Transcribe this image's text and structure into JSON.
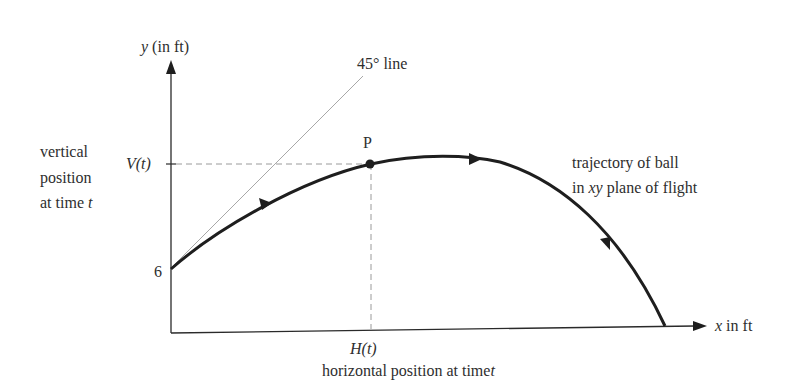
{
  "axes": {
    "y_label_var": "y",
    "y_label_unit": "(in ft)",
    "x_label_var": "x",
    "x_label_unit": "in ft",
    "y_intercept_label": "6"
  },
  "line_45": {
    "label": "45° line"
  },
  "point": {
    "label": "P"
  },
  "vertical": {
    "tick_label": "V(t)",
    "desc_line1": "vertical",
    "desc_line2": "position",
    "desc_line3_prefix": "at time ",
    "desc_line3_var": "t"
  },
  "horizontal": {
    "tick_label": "H(t)",
    "desc_prefix": "horizontal position at time",
    "desc_var": "t"
  },
  "trajectory": {
    "label_line1": "trajectory of ball",
    "label_line2_prefix": "in ",
    "label_line2_var": "xy",
    "label_line2_suffix": " plane of flight"
  },
  "colors": {
    "curve": "#1e1e1e",
    "axis": "#2a2a2a",
    "guide": "#9a9a9a",
    "line45": "#a8a8a8"
  }
}
